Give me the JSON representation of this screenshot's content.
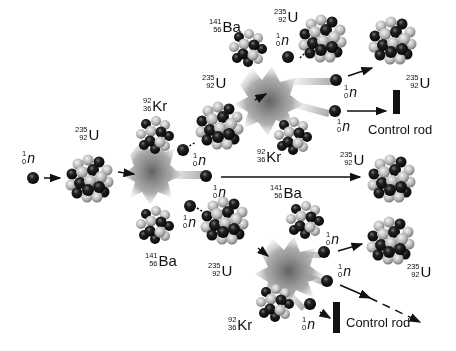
{
  "colors": {
    "neutron": "#151515",
    "proton": "#b9b9b9",
    "cloud": "#6e6e6e",
    "arrow": "#111111",
    "rod": "#111111"
  },
  "labels": {
    "n_start": {
      "mass": "1",
      "atomic": "0",
      "symbol": "n"
    },
    "u_first": {
      "mass": "235",
      "atomic": "92",
      "symbol": "U"
    },
    "kr_gen1": {
      "mass": "92",
      "atomic": "36",
      "symbol": "Kr"
    },
    "ba_gen1": {
      "mass": "141",
      "atomic": "56",
      "symbol": "Ba"
    },
    "n_gen1_a": {
      "mass": "1",
      "atomic": "0",
      "symbol": "n"
    },
    "n_gen1_b": {
      "mass": "1",
      "atomic": "0",
      "symbol": "n"
    },
    "n_gen1_c": {
      "mass": "1",
      "atomic": "0",
      "symbol": "n"
    },
    "u_upper": {
      "mass": "235",
      "atomic": "92",
      "symbol": "U"
    },
    "ba_upper": {
      "mass": "141",
      "atomic": "56",
      "symbol": "Ba"
    },
    "kr_upper": {
      "mass": "92",
      "atomic": "36",
      "symbol": "Kr"
    },
    "u_upper_target": {
      "mass": "235",
      "atomic": "92",
      "symbol": "U"
    },
    "n_upper_in": {
      "mass": "1",
      "atomic": "0",
      "symbol": "n"
    },
    "n_upper_a": {
      "mass": "1",
      "atomic": "0",
      "symbol": "n"
    },
    "n_upper_b": {
      "mass": "1",
      "atomic": "0",
      "symbol": "n"
    },
    "u_top_right": {
      "mass": "235",
      "atomic": "92",
      "symbol": "U"
    },
    "u_mid_right": {
      "mass": "235",
      "atomic": "92",
      "symbol": "U"
    },
    "u_lower": {
      "mass": "235",
      "atomic": "92",
      "symbol": "U"
    },
    "ba_lower": {
      "mass": "141",
      "atomic": "56",
      "symbol": "Ba"
    },
    "kr_lower": {
      "mass": "92",
      "atomic": "36",
      "symbol": "Kr"
    },
    "n_lower_a": {
      "mass": "1",
      "atomic": "0",
      "symbol": "n"
    },
    "n_lower_b": {
      "mass": "1",
      "atomic": "0",
      "symbol": "n"
    },
    "n_lower_c": {
      "mass": "1",
      "atomic": "0",
      "symbol": "n"
    },
    "u_lower_right": {
      "mass": "235",
      "atomic": "92",
      "symbol": "U"
    }
  },
  "control_rods": [
    {
      "label": "Control rod"
    },
    {
      "label": "Control rod"
    }
  ]
}
